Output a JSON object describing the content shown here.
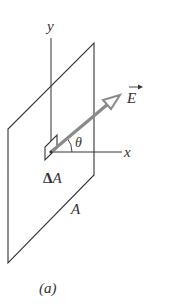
{
  "figure": {
    "caption": "(a)",
    "labels": {
      "y_axis": "y",
      "x_axis": "x",
      "field_vector": "E",
      "angle": "θ",
      "area_element_delta": "Δ",
      "area_element_A": "A",
      "surface_area": "A"
    },
    "colors": {
      "lines": "#333333",
      "arrow": "#8a8a8a",
      "background": "#ffffff"
    }
  }
}
